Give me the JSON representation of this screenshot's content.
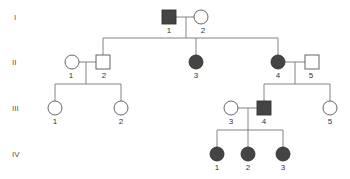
{
  "diagram": {
    "type": "pedigree",
    "generations": [
      {
        "label": "I",
        "y": 17
      },
      {
        "label": "II",
        "y": 62
      },
      {
        "label": "III",
        "y": 108
      },
      {
        "label": "IV",
        "y": 154
      }
    ],
    "individuals": [
      {
        "id": "I-1",
        "num": "1",
        "sex": "male",
        "affected": true,
        "x": 169,
        "y": 17
      },
      {
        "id": "I-2",
        "num": "2",
        "sex": "female",
        "affected": false,
        "x": 201,
        "y": 17
      },
      {
        "id": "II-1",
        "num": "1",
        "sex": "female",
        "affected": false,
        "x": 72,
        "y": 62
      },
      {
        "id": "II-2",
        "num": "2",
        "sex": "male",
        "affected": false,
        "x": 103,
        "y": 62
      },
      {
        "id": "II-3",
        "num": "3",
        "sex": "female",
        "affected": true,
        "x": 196,
        "y": 62
      },
      {
        "id": "II-4",
        "num": "4",
        "sex": "female",
        "affected": true,
        "x": 278,
        "y": 62
      },
      {
        "id": "II-5",
        "num": "5",
        "sex": "male",
        "affected": false,
        "x": 312,
        "y": 62
      },
      {
        "id": "III-1",
        "num": "1",
        "sex": "female",
        "affected": false,
        "x": 55,
        "y": 108
      },
      {
        "id": "III-2",
        "num": "2",
        "sex": "female",
        "affected": false,
        "x": 121,
        "y": 108
      },
      {
        "id": "III-3",
        "num": "3",
        "sex": "female",
        "affected": false,
        "x": 231,
        "y": 108
      },
      {
        "id": "III-4",
        "num": "4",
        "sex": "male",
        "affected": true,
        "x": 264,
        "y": 108
      },
      {
        "id": "III-5",
        "num": "5",
        "sex": "female",
        "affected": false,
        "x": 330,
        "y": 108
      },
      {
        "id": "IV-1",
        "num": "1",
        "sex": "female",
        "affected": true,
        "x": 217,
        "y": 154
      },
      {
        "id": "IV-2",
        "num": "2",
        "sex": "female",
        "affected": true,
        "x": 248,
        "y": 154
      },
      {
        "id": "IV-3",
        "num": "3",
        "sex": "female",
        "affected": true,
        "x": 283,
        "y": 154
      }
    ],
    "colors": {
      "affected": "#444444",
      "unaffected": "#ffffff",
      "line": "#777777"
    }
  }
}
